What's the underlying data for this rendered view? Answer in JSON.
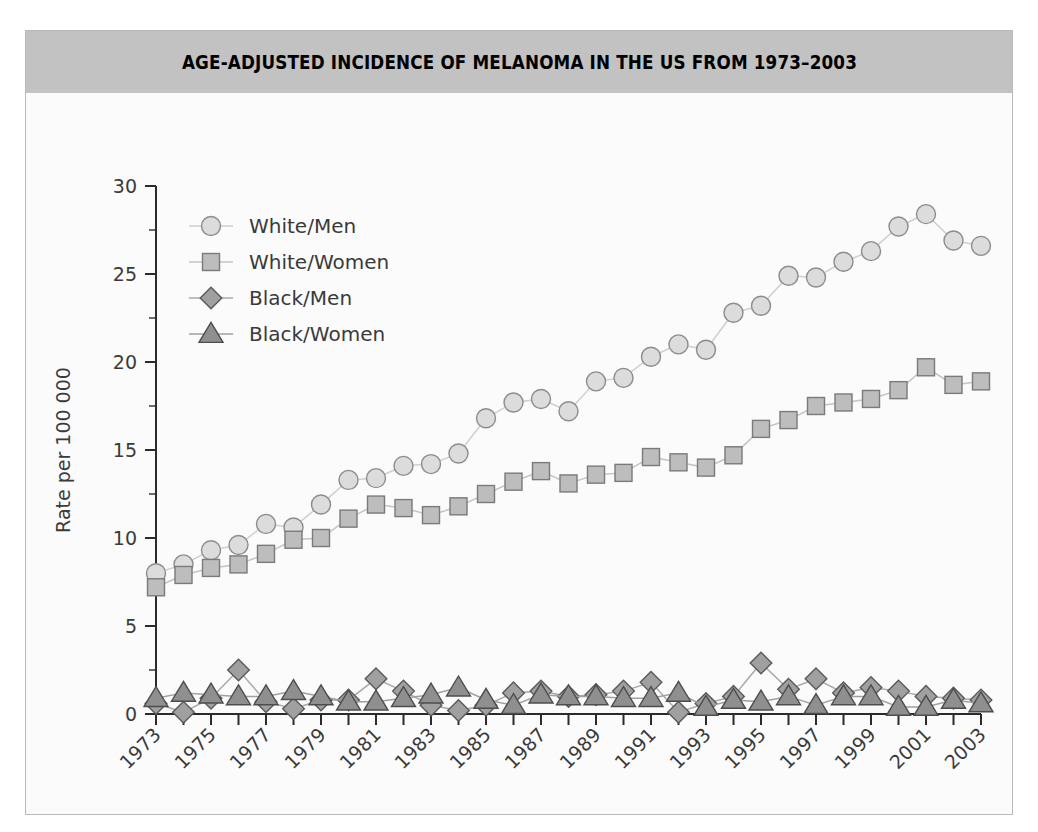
{
  "figure": {
    "title": "AGE-ADJUSTED INCIDENCE OF MELANOMA IN THE US FROM 1973–2003",
    "banner_color": "#c2c2c2",
    "frame_color": "#b9b9b9",
    "background_color": "#fbfbfb"
  },
  "chart_data": {
    "type": "line",
    "title": "AGE-ADJUSTED INCIDENCE OF MELANOMA IN THE US FROM 1973–2003",
    "xlabel": "Year of diagnosis",
    "ylabel": "Rate per 100 000",
    "xlim": [
      1973,
      2003
    ],
    "ylim": [
      0,
      30
    ],
    "ytick_values": [
      0,
      5,
      10,
      15,
      20,
      25,
      30
    ],
    "ytick_labels": [
      "0",
      "5",
      "10",
      "15",
      "20",
      "25",
      "30"
    ],
    "yminor_values": [
      2.5,
      7.5,
      12.5,
      17.5,
      22.5,
      27.5
    ],
    "x": [
      1973,
      1974,
      1975,
      1976,
      1977,
      1978,
      1979,
      1980,
      1981,
      1982,
      1983,
      1984,
      1985,
      1986,
      1987,
      1988,
      1989,
      1990,
      1991,
      1992,
      1993,
      1994,
      1995,
      1996,
      1997,
      1998,
      1999,
      2000,
      2001,
      2002,
      2003
    ],
    "xtick_values": [
      1973,
      1974,
      1975,
      1976,
      1977,
      1978,
      1979,
      1980,
      1981,
      1982,
      1983,
      1984,
      1985,
      1986,
      1987,
      1988,
      1989,
      1990,
      1991,
      1992,
      1993,
      1994,
      1995,
      1996,
      1997,
      1998,
      1999,
      2000,
      2001,
      2002,
      2003
    ],
    "xtick_labels_shown": [
      "1973",
      "1975",
      "1977",
      "1979",
      "1981",
      "1983",
      "1985",
      "1987",
      "1989",
      "1991",
      "1993",
      "1995",
      "1997",
      "1999",
      "2001",
      "2003"
    ],
    "grid": false,
    "legend_position": "upper left",
    "series": [
      {
        "name": "White/Men",
        "marker": "circle",
        "fill": "#dcdcdc",
        "stroke": "#8c8c8c",
        "line_color": "#cfcfcf",
        "values": [
          8.0,
          8.5,
          9.3,
          9.6,
          10.8,
          10.6,
          11.9,
          13.3,
          13.4,
          14.1,
          14.2,
          14.8,
          16.8,
          17.7,
          17.9,
          17.2,
          18.9,
          19.1,
          20.3,
          21.0,
          20.7,
          22.8,
          23.2,
          24.9,
          24.8,
          25.7,
          26.3,
          27.7,
          28.4,
          26.9,
          26.6
        ]
      },
      {
        "name": "White/Women",
        "marker": "square",
        "fill": "#bdbdbd",
        "stroke": "#7a7a7a",
        "line_color": "#c4c4c4",
        "values": [
          7.2,
          7.9,
          8.3,
          8.5,
          9.1,
          9.9,
          10.0,
          11.1,
          11.9,
          11.7,
          11.3,
          11.8,
          12.5,
          13.2,
          13.8,
          13.1,
          13.6,
          13.7,
          14.6,
          14.3,
          14.0,
          14.7,
          16.2,
          16.7,
          17.5,
          17.7,
          17.9,
          18.4,
          19.7,
          18.7,
          18.9
        ]
      },
      {
        "name": "Black/Men",
        "marker": "diamond",
        "fill": "#a0a0a0",
        "stroke": "#5a5a5a",
        "line_color": "#a8a8a8",
        "values": [
          0.6,
          0.1,
          0.9,
          2.5,
          0.7,
          0.3,
          0.8,
          0.8,
          2.0,
          1.3,
          0.5,
          0.2,
          0.5,
          1.2,
          1.3,
          1.0,
          1.1,
          1.3,
          1.8,
          0.1,
          0.6,
          1.0,
          2.9,
          1.4,
          2.0,
          1.2,
          1.5,
          1.3,
          1.0,
          0.9,
          0.8
        ]
      },
      {
        "name": "Black/Women",
        "marker": "triangle",
        "fill": "#8f8f8f",
        "stroke": "#4d4d4d",
        "line_color": "#a0a0a0",
        "values": [
          0.9,
          1.2,
          1.1,
          1.0,
          1.0,
          1.3,
          1.0,
          0.7,
          0.7,
          0.9,
          1.1,
          1.5,
          0.8,
          0.5,
          1.1,
          1.0,
          1.0,
          0.9,
          0.9,
          1.2,
          0.4,
          0.8,
          0.7,
          1.0,
          0.5,
          1.0,
          1.0,
          0.4,
          0.4,
          0.8,
          0.6
        ]
      }
    ]
  }
}
